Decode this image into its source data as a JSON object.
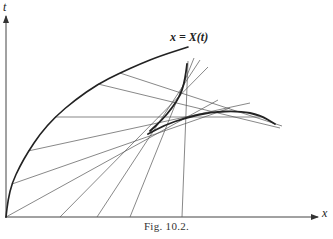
{
  "figure": {
    "caption": "Fig. 10.2.",
    "curve_label": "x = X(t)",
    "axis_labels": {
      "vertical": "t",
      "horizontal": "x"
    }
  },
  "colors": {
    "ink": "#222222",
    "thin": "#555555",
    "background": "#ffffff"
  },
  "geometry": {
    "origin": [
      6,
      217
    ],
    "boundary_curve": [
      [
        6,
        217
      ],
      [
        8,
        200
      ],
      [
        12,
        183
      ],
      [
        20,
        166
      ],
      [
        28,
        152
      ],
      [
        40,
        134
      ],
      [
        55,
        117
      ],
      [
        75,
        100
      ],
      [
        98,
        84
      ],
      [
        120,
        73
      ],
      [
        140,
        64
      ],
      [
        160,
        56
      ],
      [
        188,
        47
      ]
    ],
    "envelope_upper": [
      [
        150,
        131
      ],
      [
        162,
        120
      ],
      [
        172,
        108
      ],
      [
        180,
        96
      ],
      [
        184,
        84
      ],
      [
        186,
        72
      ],
      [
        187,
        64
      ]
    ],
    "envelope_lower": [
      [
        148,
        134
      ],
      [
        165,
        125
      ],
      [
        185,
        118
      ],
      [
        210,
        112
      ],
      [
        240,
        111
      ],
      [
        260,
        115
      ],
      [
        275,
        124
      ]
    ],
    "characteristics_from_curve": [
      [
        [
          120,
          73
        ],
        [
          282,
          126
        ]
      ],
      [
        [
          98,
          84
        ],
        [
          280,
          128
        ]
      ],
      [
        [
          55,
          117
        ],
        [
          262,
          117
        ]
      ],
      [
        [
          28,
          151
        ],
        [
          250,
          103
        ]
      ],
      [
        [
          12,
          184
        ],
        [
          230,
          108
        ]
      ],
      [
        [
          6,
          217
        ],
        [
          218,
          100
        ]
      ]
    ],
    "characteristics_from_axis": [
      [
        [
          60,
          217
        ],
        [
          208,
          67
        ]
      ],
      [
        [
          97,
          217
        ],
        [
          200,
          60
        ]
      ],
      [
        [
          130,
          217
        ],
        [
          194,
          58
        ]
      ],
      [
        [
          182,
          217
        ],
        [
          188,
          61
        ]
      ]
    ]
  }
}
